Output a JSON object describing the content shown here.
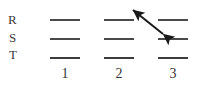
{
  "figure": {
    "type": "energy-level-diagram",
    "width": 204,
    "height": 90,
    "background": "#ffffff",
    "line_color": "#4a4a4a",
    "text_color": "#343434",
    "arrow_color": "#1a1a1a"
  },
  "row_labels": [
    {
      "id": "R",
      "text": "R",
      "x": 8,
      "y": 13
    },
    {
      "id": "S",
      "text": "S",
      "x": 9,
      "y": 31
    },
    {
      "id": "T",
      "text": "T",
      "x": 9,
      "y": 48
    }
  ],
  "column_labels": [
    {
      "id": "1",
      "text": "1",
      "x": 58,
      "y": 67
    },
    {
      "id": "2",
      "text": "2",
      "x": 112,
      "y": 67
    },
    {
      "id": "3",
      "text": "3",
      "x": 166,
      "y": 67
    }
  ],
  "levels": [
    {
      "row": "R",
      "column": "1",
      "x": 50,
      "y": 19,
      "width": 30,
      "bold": false
    },
    {
      "row": "S",
      "column": "1",
      "x": 50,
      "y": 38,
      "width": 30,
      "bold": false
    },
    {
      "row": "T",
      "column": "1",
      "x": 50,
      "y": 57,
      "width": 30,
      "bold": true
    },
    {
      "row": "R",
      "column": "2",
      "x": 104,
      "y": 19,
      "width": 30,
      "bold": false
    },
    {
      "row": "S",
      "column": "2",
      "x": 104,
      "y": 38,
      "width": 30,
      "bold": false
    },
    {
      "row": "T",
      "column": "2",
      "x": 104,
      "y": 57,
      "width": 30,
      "bold": true
    },
    {
      "row": "R",
      "column": "3",
      "x": 158,
      "y": 19,
      "width": 30,
      "bold": false
    },
    {
      "row": "S",
      "column": "3",
      "x": 158,
      "y": 38,
      "width": 30,
      "bold": false
    },
    {
      "row": "T",
      "column": "3",
      "x": 158,
      "y": 57,
      "width": 30,
      "bold": true
    }
  ],
  "arrow": {
    "id": "transition-arrow",
    "double_headed": true,
    "from_label": "column 3 level S",
    "to_label": "column 2 level R",
    "x1": 163,
    "y1": 34,
    "x2": 133,
    "y2": 10,
    "stroke_width": 2.1,
    "color": "#1a1a1a"
  }
}
